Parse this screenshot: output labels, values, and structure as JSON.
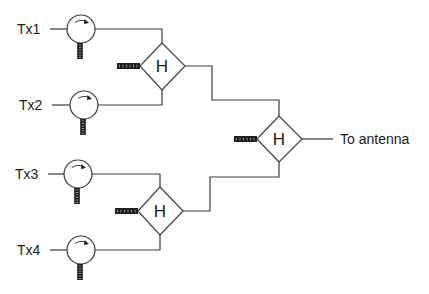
{
  "diagram": {
    "type": "combiner-network",
    "inputs": [
      {
        "label": "Tx1",
        "circulator": "circulator-1"
      },
      {
        "label": "Tx2",
        "circulator": "circulator-2"
      },
      {
        "label": "Tx3",
        "circulator": "circulator-3"
      },
      {
        "label": "Tx4",
        "circulator": "circulator-4"
      }
    ],
    "hybrids": [
      {
        "id": "hybrid-1",
        "label": "H",
        "inputs": [
          "Tx1",
          "Tx2"
        ]
      },
      {
        "id": "hybrid-2",
        "label": "H",
        "inputs": [
          "Tx3",
          "Tx4"
        ]
      },
      {
        "id": "hybrid-3",
        "label": "H",
        "inputs": [
          "hybrid-1",
          "hybrid-2"
        ]
      }
    ],
    "output": {
      "label": "To antenna"
    },
    "colors": {
      "line": "#3a3a3a",
      "termination": "#1e1e1e",
      "background": "#ffffff"
    }
  }
}
